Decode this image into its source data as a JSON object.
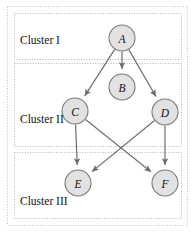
{
  "figure": {
    "background_color": "#ffffff",
    "width": 194,
    "height": 232
  },
  "style": {
    "node_fill": "#e2e2e2",
    "node_stroke": "#7a7a7a",
    "edge_color": "#6e6e6e",
    "cluster_border_color": "#b5b5b5",
    "outer_border_color": "#c4c4c4",
    "label_color": "#111111"
  },
  "clusters": [
    {
      "id": "cluster-1",
      "label": "Cluster I",
      "x": 14,
      "y": 13,
      "width": 167,
      "height": 46,
      "label_x": 20,
      "label_y": 44
    },
    {
      "id": "cluster-2",
      "label": "Cluster II",
      "x": 14,
      "y": 63,
      "width": 167,
      "height": 83,
      "label_x": 20,
      "label_y": 123
    },
    {
      "id": "cluster-3",
      "label": "Cluster III",
      "x": 14,
      "y": 152,
      "width": 167,
      "height": 66,
      "label_x": 20,
      "label_y": 205
    }
  ],
  "nodes": [
    {
      "id": "A",
      "label": "A",
      "cx": 122,
      "cy": 38,
      "r": 13,
      "cluster": "Cluster I"
    },
    {
      "id": "B",
      "label": "B",
      "cx": 122,
      "cy": 87,
      "r": 13,
      "cluster": "Cluster II"
    },
    {
      "id": "C",
      "label": "C",
      "cx": 75,
      "cy": 111,
      "r": 13,
      "cluster": "Cluster II"
    },
    {
      "id": "D",
      "label": "D",
      "cx": 165,
      "cy": 112,
      "r": 13,
      "cluster": "Cluster II"
    },
    {
      "id": "E",
      "label": "E",
      "cx": 78,
      "cy": 183,
      "r": 13,
      "cluster": "Cluster III"
    },
    {
      "id": "F",
      "label": "F",
      "cx": 165,
      "cy": 183,
      "r": 13,
      "cluster": "Cluster III"
    }
  ],
  "edges": [
    {
      "id": "edge-a-b",
      "from": "A",
      "to": "B",
      "directed": true
    },
    {
      "id": "edge-a-c",
      "from": "A",
      "to": "C",
      "directed": true
    },
    {
      "id": "edge-a-d",
      "from": "A",
      "to": "D",
      "directed": true
    },
    {
      "id": "edge-c-e",
      "from": "C",
      "to": "E",
      "directed": true
    },
    {
      "id": "edge-c-f",
      "from": "C",
      "to": "F",
      "directed": true
    },
    {
      "id": "edge-d-e",
      "from": "D",
      "to": "E",
      "directed": true
    },
    {
      "id": "edge-d-f",
      "from": "D",
      "to": "F",
      "directed": true
    }
  ]
}
